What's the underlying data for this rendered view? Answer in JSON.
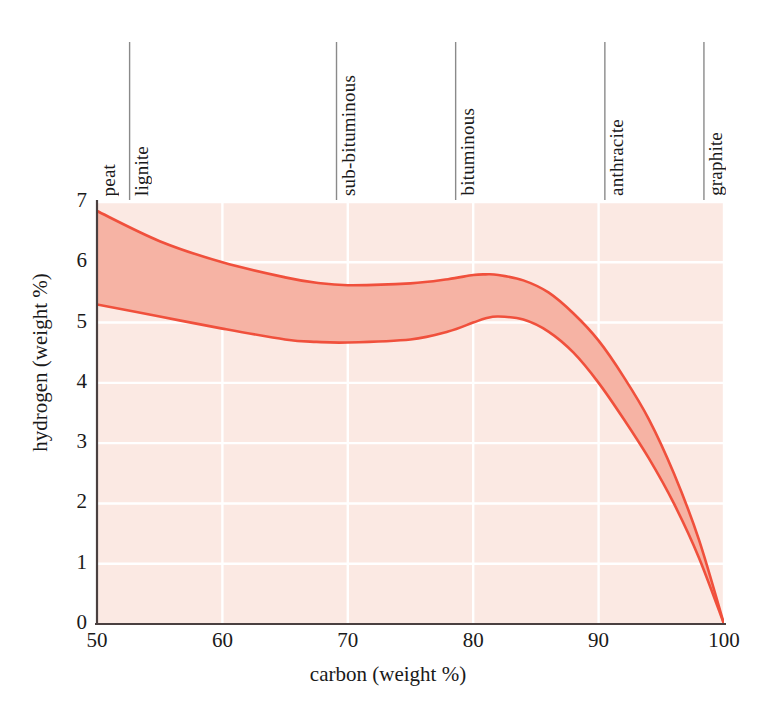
{
  "chart_data": {
    "type": "area",
    "title": "",
    "subtitle": "",
    "xlabel": "carbon (weight %)",
    "ylabel": "hydrogen (weight %)",
    "xlim": [
      50,
      100
    ],
    "ylim": [
      0,
      7
    ],
    "xticks": [
      50,
      60,
      70,
      80,
      90,
      100
    ],
    "yticks": [
      0,
      1,
      2,
      3,
      4,
      5,
      6,
      7
    ],
    "grid": true,
    "legend_position": "none",
    "band_fill_color": "#f6b3a4",
    "band_line_color": "#f0503c",
    "plot_background_color": "#fbe9e3",
    "gridline_color": "#ffffff",
    "axis_color": "#4a4040",
    "band_label": "hydrogen content range of coals",
    "x": [
      50,
      55,
      60,
      65,
      67.5,
      70,
      75,
      78,
      80,
      81,
      82,
      84,
      86,
      88,
      90,
      92,
      94,
      96,
      98,
      100
    ],
    "series": [
      {
        "name": "upper bound",
        "values": [
          6.85,
          6.35,
          6.0,
          5.75,
          5.66,
          5.62,
          5.65,
          5.72,
          5.79,
          5.8,
          5.79,
          5.7,
          5.5,
          5.15,
          4.7,
          4.1,
          3.4,
          2.5,
          1.4,
          0.0
        ]
      },
      {
        "name": "lower bound",
        "values": [
          5.3,
          5.1,
          4.9,
          4.72,
          4.68,
          4.67,
          4.72,
          4.85,
          5.0,
          5.07,
          5.1,
          5.05,
          4.85,
          4.5,
          4.0,
          3.4,
          2.75,
          2.0,
          1.1,
          0.0
        ]
      }
    ],
    "annotations": [
      {
        "label": "peat",
        "x_start": 50.0,
        "x_end": 52.6
      },
      {
        "label": "lignite",
        "x_start": 52.6,
        "x_end": 69.1
      },
      {
        "label": "sub-bituminous",
        "x_start": 69.1,
        "x_end": 78.6
      },
      {
        "label": "bituminous",
        "x_start": 78.6,
        "x_end": 90.5
      },
      {
        "label": "anthracite",
        "x_start": 90.5,
        "x_end": 98.4
      },
      {
        "label": "graphite",
        "x_start": 98.4,
        "x_end": 100.0
      }
    ],
    "category_divider_color": "#8a8a8a"
  }
}
